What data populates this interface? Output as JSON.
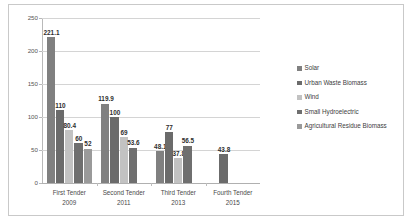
{
  "chart_data": {
    "type": "bar",
    "title": "",
    "subtitle": "",
    "xlabel": "",
    "ylabel": "",
    "ylim": [
      0,
      250
    ],
    "yticks": [
      0,
      50,
      100,
      150,
      200,
      250
    ],
    "grid": true,
    "legend_position": "right",
    "categories": [
      "First Tender",
      "Second Tender",
      "Third Tender",
      "Fourth Tender"
    ],
    "category_years": [
      "2009",
      "2011",
      "2013",
      "2015"
    ],
    "series": [
      {
        "name": "Solar",
        "color": "#808080",
        "values": [
          221.1,
          119.9,
          48.1,
          null
        ],
        "labels": [
          "221.1",
          "119.9",
          "48.1",
          ""
        ]
      },
      {
        "name": "Urban Waste Biomass",
        "color": "#6b6b6b",
        "values": [
          110,
          100,
          77,
          43.8
        ],
        "labels": [
          "110",
          "100",
          "77",
          "43.8"
        ]
      },
      {
        "name": "Wind",
        "color": "#c2c2c2",
        "values": [
          80.4,
          69,
          37.8,
          null
        ],
        "labels": [
          "80.4",
          "69",
          "37.8",
          ""
        ]
      },
      {
        "name": "Small Hydroelectric",
        "color": "#6f6f6f",
        "values": [
          60,
          53.6,
          56.5,
          null
        ],
        "labels": [
          "60",
          "53.6",
          "56.5",
          ""
        ]
      },
      {
        "name": "Agricultural Residue Biomass",
        "color": "#9a9a9a",
        "values": [
          52,
          null,
          null,
          null
        ],
        "labels": [
          "52",
          "",
          "",
          ""
        ]
      }
    ]
  },
  "axis": {
    "ytick_labels": [
      "250",
      "200",
      "150",
      "100",
      "50",
      "0"
    ]
  },
  "legend": {
    "items": [
      {
        "label": "Solar"
      },
      {
        "label": "Urban Waste Biomass"
      },
      {
        "label": "Wind"
      },
      {
        "label": "Small Hydroelectric"
      },
      {
        "label": "Agricultural Residue Biomass"
      }
    ]
  }
}
